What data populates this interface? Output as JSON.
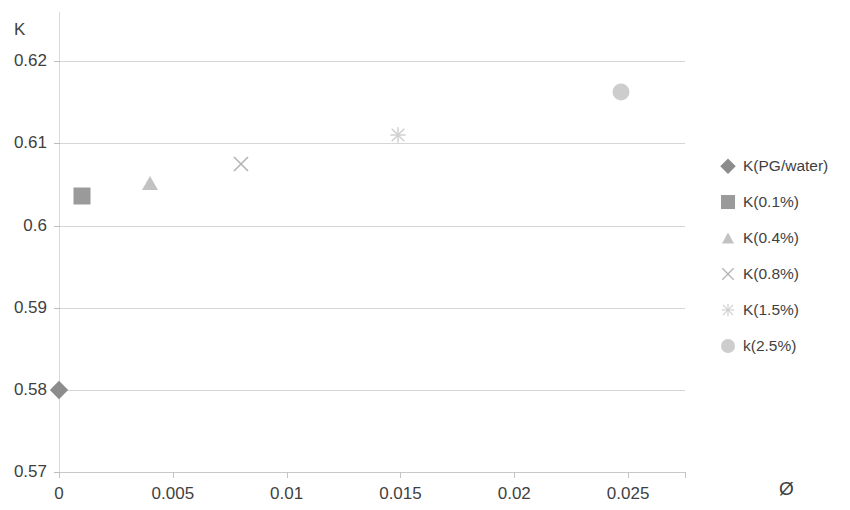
{
  "chart_data": {
    "type": "scatter",
    "title": "",
    "ylabel": "K",
    "xlabel": "Ø",
    "xlim": [
      0,
      0.0275
    ],
    "ylim": [
      0.57,
      0.626
    ],
    "grid": true,
    "legend_position": "right",
    "x_ticks": [
      "0",
      "0.005",
      "0.01",
      "0.015",
      "0.02",
      "0.025"
    ],
    "x_tick_values": [
      0,
      0.005,
      0.01,
      0.015,
      0.02,
      0.025
    ],
    "y_ticks": [
      "0.57",
      "0.58",
      "0.59",
      "0.6",
      "0.61",
      "0.62"
    ],
    "y_tick_values": [
      0.57,
      0.58,
      0.59,
      0.6,
      0.61,
      0.62
    ],
    "series": [
      {
        "name": "K(PG/water)",
        "marker": "diamond",
        "color": "#8c8c8c",
        "points": [
          {
            "x": 0,
            "y": 0.58
          }
        ]
      },
      {
        "name": "K(0.1%)",
        "marker": "square",
        "color": "#9a9a9a",
        "points": [
          {
            "x": 0.001,
            "y": 0.6036
          }
        ]
      },
      {
        "name": "K(0.4%)",
        "marker": "triangle",
        "color": "#c2c2c2",
        "points": [
          {
            "x": 0.004,
            "y": 0.6052
          }
        ]
      },
      {
        "name": "K(0.8%)",
        "marker": "x-cross",
        "color": "#b4b4b4",
        "points": [
          {
            "x": 0.008,
            "y": 0.6075
          }
        ]
      },
      {
        "name": "K(1.5%)",
        "marker": "star",
        "color": "#cfcfcf",
        "points": [
          {
            "x": 0.0149,
            "y": 0.611
          }
        ]
      },
      {
        "name": "k(2.5%)",
        "marker": "circle",
        "color": "#cdcdcd",
        "points": [
          {
            "x": 0.0247,
            "y": 0.6163
          }
        ]
      }
    ]
  },
  "axes": {
    "y_title": "K",
    "x_title": "Ø",
    "y_tick_labels": [
      "0.62",
      "0.61",
      "0.6",
      "0.59",
      "0.58",
      "0.57"
    ],
    "x_tick_labels": [
      "0",
      "0.005",
      "0.01",
      "0.015",
      "0.02",
      "0.025"
    ]
  },
  "legend": {
    "items": [
      {
        "label": "K(PG/water)",
        "marker": "diamond-marker-icon",
        "color": "#8c8c8c"
      },
      {
        "label": "K(0.1%)",
        "marker": "square-marker-icon",
        "color": "#9a9a9a"
      },
      {
        "label": "K(0.4%)",
        "marker": "triangle-marker-icon",
        "color": "#c2c2c2"
      },
      {
        "label": "K(0.8%)",
        "marker": "x-cross-marker-icon",
        "color": "#b4b4b4"
      },
      {
        "label": "K(1.5%)",
        "marker": "star-marker-icon",
        "color": "#cfcfcf"
      },
      {
        "label": "k(2.5%)",
        "marker": "circle-marker-icon",
        "color": "#cdcdcd"
      }
    ]
  }
}
